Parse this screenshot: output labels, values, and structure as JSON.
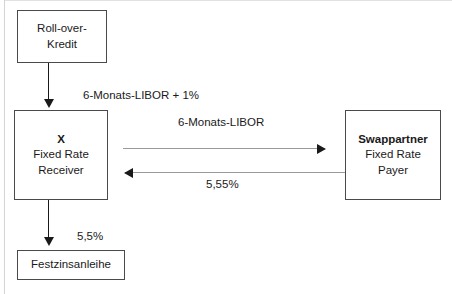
{
  "diagram": {
    "colors": {
      "box_border": "#4a4a4a",
      "text": "#1a1a1a",
      "dark_connector": "#1a1a1a",
      "light_connector": "#9a9a9a",
      "background": "#ffffff"
    },
    "nodes": [
      {
        "id": "rollover",
        "lines": [
          "Roll-over-",
          "Kredit"
        ],
        "bold": [
          false,
          false
        ]
      },
      {
        "id": "x",
        "lines": [
          "X",
          "Fixed Rate",
          "Receiver"
        ],
        "bold": [
          true,
          false,
          false
        ]
      },
      {
        "id": "swappartner",
        "lines": [
          "Swappartner",
          "Fixed Rate",
          "Payer"
        ],
        "bold": [
          true,
          false,
          false
        ]
      },
      {
        "id": "festzinsanleihe",
        "lines": [
          "Festzinsanleihe"
        ],
        "bold": [
          false
        ]
      }
    ],
    "labels": {
      "libor_plus_1": "6-Monats-LIBOR + 1%",
      "libor": "6-Monats-LIBOR",
      "fixed_rate_received": "5,55%",
      "fixed_rate_paid": "5,5%"
    }
  }
}
